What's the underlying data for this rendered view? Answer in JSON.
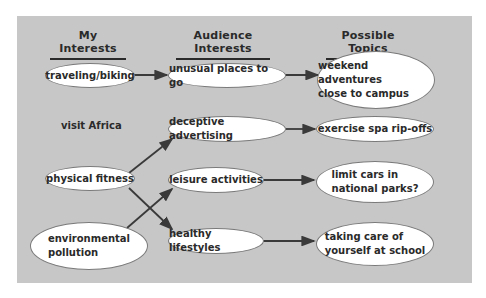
{
  "headers": {
    "my_interests": "My Interests",
    "audience_interests": "Audience Interests",
    "possible_topics": "Possible Topics"
  },
  "my_interests": {
    "traveling": "traveling/biking",
    "africa": "visit Africa",
    "fitness": "physical fitness",
    "environment": "environmental\npollution"
  },
  "audience_interests": {
    "unusual": "unusual places to go",
    "deceptive": "deceptive advertising",
    "leisure": "leisure activities",
    "healthy": "healthy lifestyles"
  },
  "topics": {
    "weekend": "weekend adventures\nclose to campus",
    "spa": "exercise spa rip-offs",
    "cars": "limit cars in\nnational parks?",
    "care": "taking care of\nyourself at school"
  },
  "colors": {
    "panel": "#c7c7c7",
    "node_fill": "#ffffff",
    "line": "#3a3a3a"
  }
}
